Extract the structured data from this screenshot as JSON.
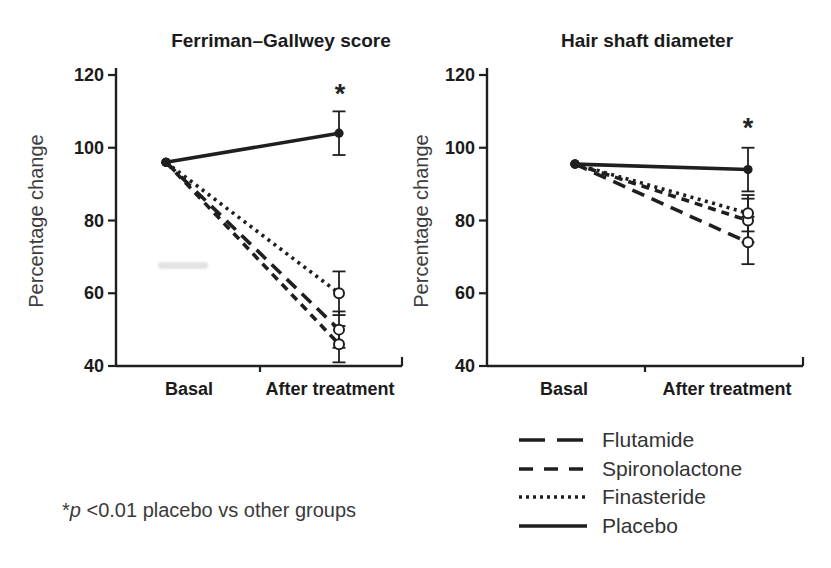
{
  "colors": {
    "ink": "#1f1f1f",
    "background": "#ffffff"
  },
  "figure": {
    "footnote": {
      "star": "*",
      "p": "p",
      "rest": " <0.01 placebo vs other groups"
    },
    "legend": [
      {
        "label": "Flutamide",
        "dash": "long-dash"
      },
      {
        "label": "Spironolactone",
        "dash": "short-dash"
      },
      {
        "label": "Finasteride",
        "dash": "dotted"
      },
      {
        "label": "Placebo",
        "dash": "solid"
      }
    ]
  },
  "chart_data": [
    {
      "type": "line",
      "title": "Ferriman–Gallwey score",
      "ylabel": "Percentage change",
      "xlabel": "",
      "categories": [
        "Basal",
        "After treatment"
      ],
      "ylim": [
        40,
        120
      ],
      "yticks": [
        40,
        60,
        80,
        100,
        120
      ],
      "grid": false,
      "legend_position": "shared-below-right",
      "significance": {
        "symbol": "*",
        "series": "Placebo",
        "category": "After treatment",
        "note": "p <0.01 placebo vs other groups"
      },
      "series": [
        {
          "name": "Flutamide",
          "dash": "long-dash",
          "marker_after": "open-circle",
          "values": [
            96,
            50
          ],
          "error_after": [
            45,
            55
          ]
        },
        {
          "name": "Spironolactone",
          "dash": "short-dash",
          "marker_after": "open-circle",
          "values": [
            96,
            46
          ],
          "error_after": [
            41,
            51
          ]
        },
        {
          "name": "Finasteride",
          "dash": "dotted",
          "marker_after": "open-circle",
          "values": [
            96,
            60
          ],
          "error_after": [
            54,
            66
          ]
        },
        {
          "name": "Placebo",
          "dash": "solid",
          "marker_after": "filled-circle",
          "values": [
            96,
            104
          ],
          "error_after": [
            98,
            110
          ]
        }
      ]
    },
    {
      "type": "line",
      "title": "Hair shaft diameter",
      "ylabel": "Percentage change",
      "xlabel": "",
      "categories": [
        "Basal",
        "After treatment"
      ],
      "ylim": [
        40,
        120
      ],
      "yticks": [
        40,
        60,
        80,
        100,
        120
      ],
      "grid": false,
      "legend_position": "shared-below-right",
      "significance": {
        "symbol": "*",
        "series": "Placebo",
        "category": "After treatment",
        "note": "p <0.01 placebo vs other groups"
      },
      "series": [
        {
          "name": "Flutamide",
          "dash": "long-dash",
          "marker_after": "open-circle",
          "values": [
            95.5,
            74
          ],
          "error_after": [
            68,
            81
          ]
        },
        {
          "name": "Spironolactone",
          "dash": "short-dash",
          "marker_after": "open-circle",
          "values": [
            95.5,
            80
          ],
          "error_after": [
            74,
            86
          ]
        },
        {
          "name": "Finasteride",
          "dash": "dotted",
          "marker_after": "open-circle",
          "values": [
            95.5,
            82
          ],
          "error_after": [
            77,
            87
          ]
        },
        {
          "name": "Placebo",
          "dash": "solid",
          "marker_after": "filled-circle",
          "values": [
            95.5,
            94
          ],
          "error_after": [
            88,
            100
          ]
        }
      ]
    }
  ]
}
